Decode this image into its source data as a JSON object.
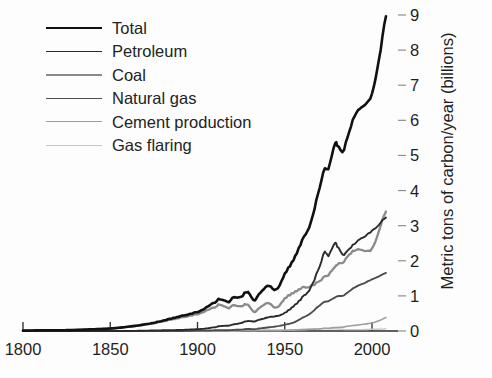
{
  "chart_data": {
    "type": "line",
    "title": "",
    "xlabel": "",
    "ylabel": "Metric tons of carbon/year (billions)",
    "xlim": [
      1800,
      2008
    ],
    "ylim": [
      0,
      9
    ],
    "grid": false,
    "legend_position": "top-left",
    "xticks": [
      1800,
      1850,
      1900,
      1950,
      2000
    ],
    "yticks": [
      0,
      1,
      2,
      3,
      4,
      5,
      6,
      7,
      8,
      9
    ],
    "x": [
      1800,
      1810,
      1820,
      1830,
      1840,
      1850,
      1860,
      1870,
      1880,
      1890,
      1900,
      1905,
      1910,
      1913,
      1918,
      1920,
      1925,
      1929,
      1932,
      1935,
      1940,
      1945,
      1950,
      1955,
      1960,
      1965,
      1970,
      1973,
      1975,
      1979,
      1980,
      1983,
      1985,
      1990,
      1995,
      2000,
      2005,
      2008
    ],
    "series": [
      {
        "name": "Total",
        "color": "#111111",
        "width": 2.6,
        "values": [
          0.01,
          0.02,
          0.02,
          0.03,
          0.05,
          0.07,
          0.12,
          0.19,
          0.29,
          0.42,
          0.54,
          0.67,
          0.82,
          0.91,
          0.81,
          0.93,
          0.98,
          1.13,
          0.88,
          1.02,
          1.3,
          1.17,
          1.63,
          2.02,
          2.58,
          3.1,
          4.08,
          4.61,
          4.62,
          5.37,
          5.3,
          5.1,
          5.37,
          6.13,
          6.4,
          6.75,
          8.0,
          8.95
        ]
      },
      {
        "name": "Petroleum",
        "color": "#2a2a2a",
        "width": 1.9,
        "values": [
          0.0,
          0.0,
          0.0,
          0.0,
          0.0,
          0.0,
          0.0,
          0.01,
          0.02,
          0.03,
          0.05,
          0.07,
          0.11,
          0.14,
          0.15,
          0.18,
          0.23,
          0.29,
          0.27,
          0.31,
          0.39,
          0.42,
          0.52,
          0.7,
          0.95,
          1.25,
          1.84,
          2.24,
          2.14,
          2.53,
          2.42,
          2.19,
          2.23,
          2.49,
          2.66,
          2.85,
          3.08,
          3.22
        ]
      },
      {
        "name": "Coal",
        "color": "#8a8a8a",
        "width": 2.3,
        "values": [
          0.01,
          0.02,
          0.02,
          0.03,
          0.05,
          0.07,
          0.12,
          0.18,
          0.27,
          0.38,
          0.48,
          0.58,
          0.68,
          0.75,
          0.64,
          0.72,
          0.71,
          0.76,
          0.55,
          0.63,
          0.81,
          0.66,
          0.93,
          1.08,
          1.23,
          1.28,
          1.43,
          1.54,
          1.59,
          1.85,
          1.9,
          1.94,
          2.06,
          2.3,
          2.29,
          2.34,
          2.99,
          3.39
        ]
      },
      {
        "name": "Natural gas",
        "color": "#4d4d4d",
        "width": 1.9,
        "values": [
          0.0,
          0.0,
          0.0,
          0.0,
          0.0,
          0.0,
          0.0,
          0.0,
          0.0,
          0.0,
          0.01,
          0.01,
          0.02,
          0.02,
          0.02,
          0.03,
          0.04,
          0.06,
          0.05,
          0.07,
          0.1,
          0.13,
          0.18,
          0.24,
          0.37,
          0.51,
          0.73,
          0.83,
          0.85,
          0.96,
          0.99,
          1.0,
          1.06,
          1.24,
          1.35,
          1.47,
          1.58,
          1.65
        ]
      },
      {
        "name": "Cement production",
        "color": "#9e9e9e",
        "width": 1.6,
        "values": [
          0.0,
          0.0,
          0.0,
          0.0,
          0.0,
          0.0,
          0.0,
          0.0,
          0.0,
          0.0,
          0.0,
          0.0,
          0.01,
          0.01,
          0.01,
          0.01,
          0.01,
          0.02,
          0.01,
          0.02,
          0.02,
          0.02,
          0.02,
          0.03,
          0.04,
          0.05,
          0.06,
          0.08,
          0.08,
          0.1,
          0.1,
          0.11,
          0.13,
          0.16,
          0.19,
          0.23,
          0.31,
          0.38
        ]
      },
      {
        "name": "Gas flaring",
        "color": "#c7c7c7",
        "width": 1.4,
        "values": [
          0.0,
          0.0,
          0.0,
          0.0,
          0.0,
          0.0,
          0.0,
          0.0,
          0.0,
          0.0,
          0.0,
          0.0,
          0.0,
          0.0,
          0.0,
          0.0,
          0.01,
          0.01,
          0.01,
          0.01,
          0.01,
          0.01,
          0.02,
          0.03,
          0.04,
          0.05,
          0.06,
          0.07,
          0.06,
          0.06,
          0.06,
          0.05,
          0.04,
          0.04,
          0.04,
          0.05,
          0.05,
          0.06
        ]
      }
    ]
  },
  "legend": {
    "items": [
      {
        "label": "Total"
      },
      {
        "label": "Petroleum"
      },
      {
        "label": "Coal"
      },
      {
        "label": "Natural gas"
      },
      {
        "label": "Cement production"
      },
      {
        "label": "Gas flaring"
      }
    ]
  },
  "axes": {
    "y_title": "Metric tons of carbon/year (billions)",
    "y_labels": [
      "9",
      "8",
      "7",
      "6",
      "5",
      "4",
      "3",
      "2",
      "1",
      "0"
    ],
    "x_labels": [
      "1800",
      "1850",
      "1900",
      "1950",
      "2000"
    ]
  }
}
